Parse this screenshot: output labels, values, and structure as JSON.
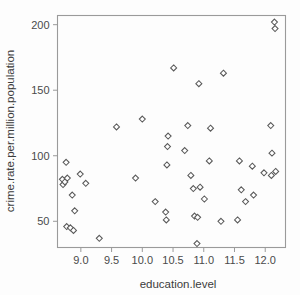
{
  "chart_data": {
    "type": "scatter",
    "title": "",
    "xlabel": "education.level",
    "ylabel": "crime.rate.per.million.population",
    "xlim": [
      8.62,
      12.33
    ],
    "ylim": [
      30,
      207
    ],
    "xticks": [
      "9.0",
      "9.5",
      "10.0",
      "10.5",
      "11.0",
      "11.5",
      "12.0"
    ],
    "xtick_values": [
      9.0,
      9.5,
      10.0,
      10.5,
      11.0,
      11.5,
      12.0
    ],
    "yticks": [
      "50",
      "100",
      "150",
      "200"
    ],
    "ytick_values": [
      50,
      100,
      150,
      200
    ],
    "grid": false,
    "legend": null,
    "marker": "open-diamond",
    "marker_color": "#5a5a5a",
    "n_points": 50,
    "points": [
      {
        "x": 8.7,
        "y": 82
      },
      {
        "x": 8.71,
        "y": 78
      },
      {
        "x": 8.74,
        "y": 80
      },
      {
        "x": 8.76,
        "y": 95
      },
      {
        "x": 8.78,
        "y": 83
      },
      {
        "x": 8.77,
        "y": 46
      },
      {
        "x": 8.83,
        "y": 45
      },
      {
        "x": 8.86,
        "y": 70
      },
      {
        "x": 8.88,
        "y": 43
      },
      {
        "x": 8.9,
        "y": 58
      },
      {
        "x": 8.99,
        "y": 86
      },
      {
        "x": 9.08,
        "y": 79
      },
      {
        "x": 9.3,
        "y": 37
      },
      {
        "x": 9.58,
        "y": 122
      },
      {
        "x": 9.89,
        "y": 83
      },
      {
        "x": 10.0,
        "y": 128
      },
      {
        "x": 10.21,
        "y": 65
      },
      {
        "x": 10.38,
        "y": 57
      },
      {
        "x": 10.39,
        "y": 51
      },
      {
        "x": 10.4,
        "y": 93
      },
      {
        "x": 10.41,
        "y": 107
      },
      {
        "x": 10.42,
        "y": 115
      },
      {
        "x": 10.51,
        "y": 167
      },
      {
        "x": 10.69,
        "y": 104
      },
      {
        "x": 10.74,
        "y": 123
      },
      {
        "x": 10.79,
        "y": 85
      },
      {
        "x": 10.83,
        "y": 75
      },
      {
        "x": 10.85,
        "y": 54
      },
      {
        "x": 10.9,
        "y": 53
      },
      {
        "x": 10.89,
        "y": 33
      },
      {
        "x": 10.92,
        "y": 155
      },
      {
        "x": 10.94,
        "y": 76
      },
      {
        "x": 11.01,
        "y": 67
      },
      {
        "x": 11.09,
        "y": 96
      },
      {
        "x": 11.11,
        "y": 121
      },
      {
        "x": 11.28,
        "y": 50
      },
      {
        "x": 11.32,
        "y": 163
      },
      {
        "x": 11.55,
        "y": 51
      },
      {
        "x": 11.58,
        "y": 96
      },
      {
        "x": 11.61,
        "y": 74
      },
      {
        "x": 11.68,
        "y": 65
      },
      {
        "x": 11.79,
        "y": 92
      },
      {
        "x": 11.81,
        "y": 70
      },
      {
        "x": 12.09,
        "y": 123
      },
      {
        "x": 12.1,
        "y": 85
      },
      {
        "x": 12.11,
        "y": 102
      },
      {
        "x": 12.17,
        "y": 88
      },
      {
        "x": 12.15,
        "y": 202
      },
      {
        "x": 12.16,
        "y": 197
      },
      {
        "x": 11.98,
        "y": 87
      }
    ]
  }
}
